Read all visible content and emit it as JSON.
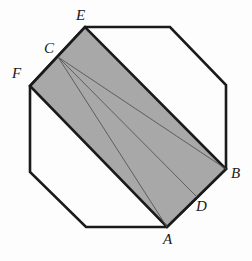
{
  "figure": {
    "background_color": "#fdfdfd",
    "outline_color": "#1a1a1a",
    "shaded_fill_color": "#a8a8a8",
    "cevian_color": "#555555",
    "outline_width": 2.6,
    "cevian_width": 0.9,
    "canvas": {
      "width": 252,
      "height": 261
    }
  },
  "chart_data": {
    "type": "diagram",
    "shapes": [
      {
        "name": "octagon",
        "kind": "polygon",
        "fill": "none",
        "stroke": "#1a1a1a",
        "points": [
          [
            85,
            27
          ],
          [
            170,
            27
          ],
          [
            226,
            85
          ],
          [
            226,
            169
          ],
          [
            167,
            227
          ],
          [
            86,
            227
          ],
          [
            30,
            172
          ],
          [
            30,
            86
          ]
        ]
      },
      {
        "name": "shaded-parallelogram",
        "kind": "polygon",
        "fill": "#a8a8a8",
        "stroke": "#1a1a1a",
        "points": [
          [
            30,
            86
          ],
          [
            85,
            27
          ],
          [
            226,
            169
          ],
          [
            167,
            227
          ]
        ]
      },
      {
        "name": "cevian-C-to-A",
        "kind": "line",
        "from": [
          58,
          57
        ],
        "to": [
          167,
          227
        ]
      },
      {
        "name": "cevian-C-to-D",
        "kind": "line",
        "from": [
          58,
          57
        ],
        "to": [
          197,
          197
        ]
      },
      {
        "name": "cevian-C-to-B",
        "kind": "line",
        "from": [
          58,
          57
        ],
        "to": [
          226,
          169
        ]
      }
    ],
    "points": [
      {
        "label": "A",
        "x": 167,
        "y": 227,
        "role": "octagon-vertex, parallelogram-vertex"
      },
      {
        "label": "B",
        "x": 226,
        "y": 169,
        "role": "octagon-vertex, parallelogram-vertex"
      },
      {
        "label": "C",
        "x": 58,
        "y": 57,
        "role": "point-on-edge-FE"
      },
      {
        "label": "D",
        "x": 197,
        "y": 197,
        "role": "point-on-edge-BA"
      },
      {
        "label": "E",
        "x": 85,
        "y": 27,
        "role": "octagon-vertex, parallelogram-vertex"
      },
      {
        "label": "F",
        "x": 30,
        "y": 86,
        "role": "octagon-vertex, parallelogram-vertex"
      }
    ]
  },
  "labels": {
    "A": {
      "text": "A",
      "left": 163,
      "top": 232
    },
    "B": {
      "text": "B",
      "left": 231,
      "top": 166
    },
    "C": {
      "text": "C",
      "left": 44,
      "top": 41
    },
    "D": {
      "text": "D",
      "left": 196,
      "top": 199
    },
    "E": {
      "text": "E",
      "left": 76,
      "top": 8
    },
    "F": {
      "text": "F",
      "left": 12,
      "top": 66
    }
  }
}
